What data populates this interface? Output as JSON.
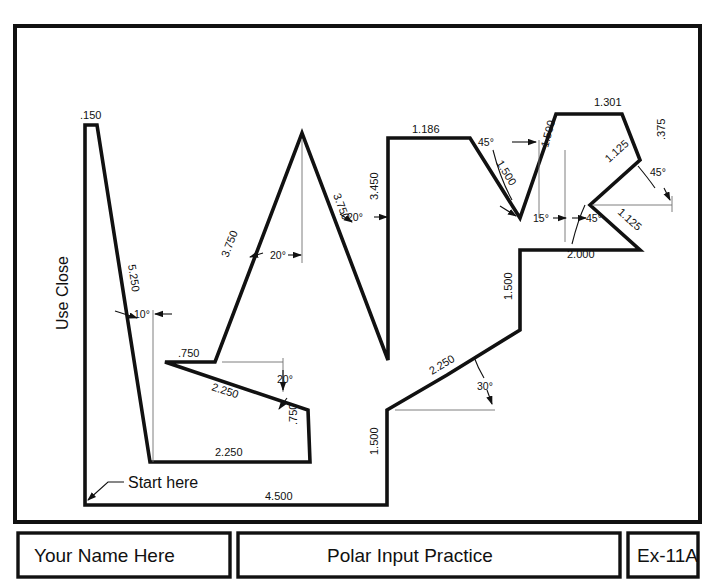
{
  "document": {
    "top_fragment": "",
    "title": "Polar Input Practice",
    "exercise_id": "Ex-11A",
    "name_field": "Your Name Here"
  },
  "title_block": {
    "left_cell": "Your Name Here",
    "center_cell": "Polar Input Practice",
    "right_cell": "Ex-11A"
  },
  "notes": {
    "use_close": "Use Close",
    "start_here": "Start here"
  },
  "dimensions": {
    "top_spike_width": ".150",
    "long_left_side": "5.250",
    "left_angle": "10°",
    "shelf_750": ".750",
    "slope_2250_upper": "2.250",
    "slope_angle_20_lower": "20°",
    "right_750": ".750",
    "bottom_2250": "2.250",
    "peak_left_side": "3.750",
    "peak_left_angle": "20°",
    "peak_right_side": "3.750",
    "peak_right_angle": "20°",
    "vertical_3450": "3.450",
    "top_1186": "1.186",
    "slope_1500_45": "1.500",
    "angle_45_upper": "45°",
    "riser_1500": "1.500",
    "angle_15": "15°",
    "top_1301": "1.301",
    "right_375": ".375",
    "zig_upper_1125": "1.125",
    "zig_angle_45_upper": "45°",
    "zig_lower_1125": "1.125",
    "zig_angle_45_lower": "45°",
    "base_2000": "2.000",
    "vertical_1500_mid": "1.500",
    "slope_2250_lower": "2.250",
    "angle_30": "30°",
    "vertical_1500_bottom": "1.500",
    "bottom_4500": "4.500"
  },
  "colors": {
    "ink": "#111111",
    "thin": "#6f6f6f",
    "paper": "#ffffff"
  }
}
